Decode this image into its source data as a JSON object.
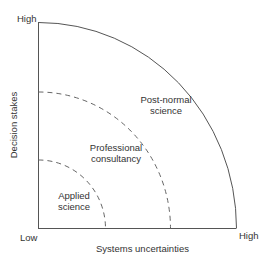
{
  "diagram": {
    "type": "quarter-circle zone diagram",
    "x_axis": {
      "label": "Systems uncertainties",
      "low": "Low",
      "high": "High"
    },
    "y_axis": {
      "label": "Decision stakes",
      "high": "High"
    },
    "zones": [
      {
        "name": "applied-science",
        "label_line1": "Applied",
        "label_line2": "science",
        "boundary": "dashed"
      },
      {
        "name": "professional-consultancy",
        "label_line1": "Professional",
        "label_line2": "consultancy",
        "boundary": "dashed"
      },
      {
        "name": "post-normal-science",
        "label_line1": "Post-normal",
        "label_line2": "science",
        "boundary": "solid"
      }
    ],
    "colors": {
      "line": "#555555",
      "text": "#333333",
      "background": "#ffffff"
    }
  }
}
